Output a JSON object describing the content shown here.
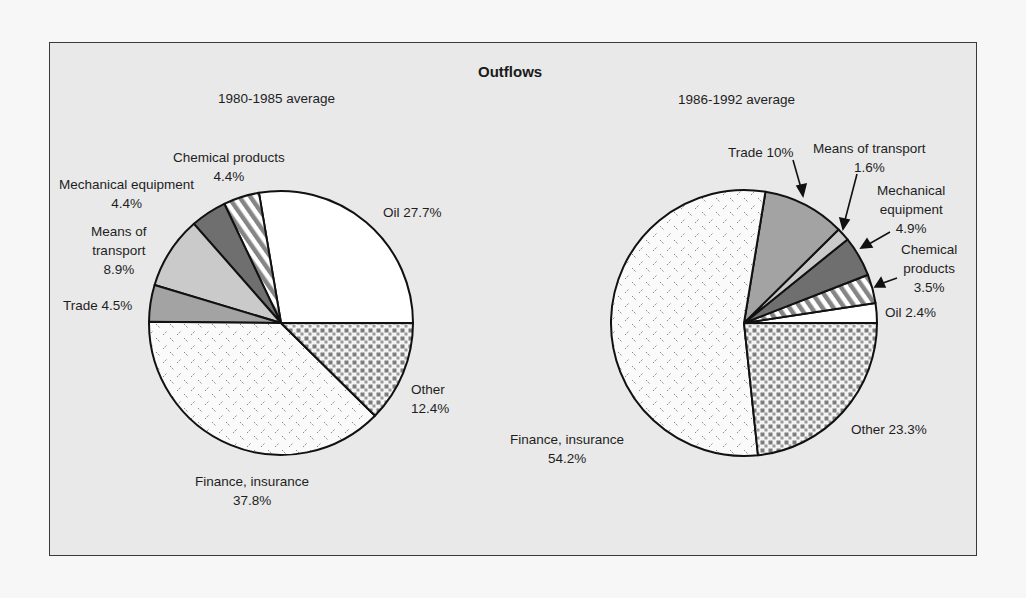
{
  "title": "Outflows",
  "left": {
    "subtitle": "1980-1985 average",
    "labels": {
      "oil": "Oil 27.7%",
      "chemical": "Chemical products\n4.4%",
      "mechanical": "Mechanical equipment\n4.4%",
      "transport": "Means of\ntransport\n8.9%",
      "trade": "Trade 4.5%",
      "finance": "Finance, insurance\n37.8%",
      "other": "Other\n12.4%"
    }
  },
  "right": {
    "subtitle": "1986-1992 average",
    "labels": {
      "trade": "Trade 10%",
      "transport": "Means of transport\n1.6%",
      "mechanical": "Mechanical\nequipment\n4.9%",
      "chemical": "Chemical\nproducts\n3.5%",
      "oil": "Oil  2.4%",
      "finance": "Finance, insurance\n54.2%",
      "other": "Other  23.3%"
    }
  },
  "colors": {
    "frame_bg": "#e9e9e9",
    "outline": "#111111",
    "oil": "#ffffff",
    "trade": "#a3a3a3",
    "transport": "#cacaca",
    "mechanical": "#6f6f6f",
    "pattern_gray": "#858585"
  },
  "chart_data": [
    {
      "type": "pie",
      "title": "Outflows — 1980-1985 average",
      "start_angle_deg": 0,
      "direction": "counterclockwise",
      "categories": [
        "Oil",
        "Chemical products",
        "Mechanical equipment",
        "Means of transport",
        "Trade",
        "Finance, insurance",
        "Other"
      ],
      "values": [
        27.7,
        4.4,
        4.4,
        8.9,
        4.5,
        37.8,
        12.4
      ],
      "unit": "%"
    },
    {
      "type": "pie",
      "title": "Outflows — 1986-1992 average",
      "start_angle_deg": 0,
      "direction": "counterclockwise",
      "categories": [
        "Oil",
        "Chemical products",
        "Mechanical equipment",
        "Means of transport",
        "Trade",
        "Finance, insurance",
        "Other"
      ],
      "values": [
        2.4,
        3.5,
        4.9,
        1.6,
        10.0,
        54.2,
        23.3
      ],
      "unit": "%"
    }
  ]
}
